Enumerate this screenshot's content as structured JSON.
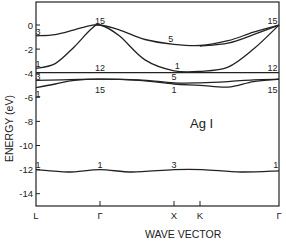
{
  "chart_data": {
    "type": "line",
    "title": "Ag I",
    "xlabel": "WAVE VECTOR",
    "ylabel": "ENERGY (eV)",
    "ylim": [
      -15,
      1.9
    ],
    "grid": false,
    "legend": null,
    "x_ticks": [
      {
        "label": "L",
        "pos": 0.0
      },
      {
        "label": "Γ",
        "pos": 1.0
      },
      {
        "label": "X",
        "pos": 2.15
      },
      {
        "label": "K",
        "pos": 2.56
      },
      {
        "label": "Γ",
        "pos": 3.8
      }
    ],
    "y_ticks": [
      0,
      -2,
      -4,
      -6,
      -8,
      -10,
      -12,
      -14
    ],
    "y_tick_labels": [
      "0",
      "-2",
      "-4",
      "-6",
      "-8",
      "-10",
      "-12",
      "-14"
    ],
    "series": [
      {
        "name": "upper valence band 3→15→5→15",
        "x": [
          0,
          0.3,
          0.6,
          0.85,
          1.0,
          1.3,
          1.7,
          2.15,
          2.56,
          3.0,
          3.4,
          3.8
        ],
        "y": [
          -0.9,
          -0.8,
          -0.4,
          -0.05,
          0.0,
          -0.4,
          -1.2,
          -1.6,
          -1.7,
          -1.3,
          -0.6,
          0.0
        ]
      },
      {
        "name": "upper valence band 1→15→1→15",
        "x": [
          0,
          0.3,
          0.6,
          0.85,
          1.0,
          1.3,
          1.7,
          2.15,
          2.56,
          3.0,
          3.4,
          3.8
        ],
        "y": [
          -3.6,
          -3.2,
          -1.8,
          -0.4,
          0.0,
          -0.9,
          -2.9,
          -3.8,
          -3.85,
          -3.5,
          -2.0,
          0.0
        ]
      },
      {
        "name": "upper valence band (K branch)",
        "x": [
          2.56,
          3.0,
          3.4,
          3.8
        ],
        "y": [
          -1.75,
          -1.5,
          -0.8,
          0.0
        ]
      },
      {
        "name": "flat band 12",
        "x": [
          0,
          1.0,
          2.15,
          2.56,
          3.8
        ],
        "y": [
          -3.95,
          -3.95,
          -3.95,
          -3.95,
          -3.95
        ]
      },
      {
        "name": "band 3→15→5→15",
        "x": [
          0,
          0.4,
          1.0,
          1.6,
          2.15,
          2.56,
          3.0,
          3.4,
          3.8
        ],
        "y": [
          -4.6,
          -4.55,
          -4.5,
          -4.55,
          -4.8,
          -4.8,
          -4.7,
          -4.55,
          -4.5
        ]
      },
      {
        "name": "band 1→15→1→15",
        "x": [
          0,
          0.3,
          0.6,
          1.0,
          1.6,
          2.15,
          2.56,
          3.0,
          3.4,
          3.8
        ],
        "y": [
          -5.2,
          -4.9,
          -4.6,
          -4.5,
          -4.6,
          -4.9,
          -5.0,
          -5.15,
          -4.7,
          -4.5
        ]
      },
      {
        "name": "low band 1→1→3→1",
        "x": [
          0,
          0.5,
          1.0,
          1.5,
          2.15,
          2.6,
          3.2,
          3.8
        ],
        "y": [
          -12.0,
          -12.2,
          -12.0,
          -12.2,
          -12.0,
          -12.0,
          -12.2,
          -12.1
        ]
      }
    ],
    "annotations": [
      {
        "text": "3",
        "x": 0.03,
        "y": -0.55
      },
      {
        "text": "15",
        "x": 1.0,
        "y": 0.35
      },
      {
        "text": "5",
        "x": 2.1,
        "y": -1.15
      },
      {
        "text": "15",
        "x": 3.7,
        "y": 0.35
      },
      {
        "text": "1",
        "x": 0.03,
        "y": -3.25
      },
      {
        "text": "1",
        "x": 2.2,
        "y": -3.4
      },
      {
        "text": "12",
        "x": 1.0,
        "y": -3.6
      },
      {
        "text": "12",
        "x": 3.7,
        "y": -3.6
      },
      {
        "text": "3",
        "x": 0.03,
        "y": -4.35
      },
      {
        "text": "5",
        "x": 2.15,
        "y": -4.3
      },
      {
        "text": "1",
        "x": 0.03,
        "y": -5.7
      },
      {
        "text": "15",
        "x": 1.0,
        "y": -5.4
      },
      {
        "text": "1",
        "x": 2.15,
        "y": -5.4
      },
      {
        "text": "15",
        "x": 3.7,
        "y": -5.4
      },
      {
        "text": "1",
        "x": 0.03,
        "y": -11.6
      },
      {
        "text": "1",
        "x": 1.0,
        "y": -11.6
      },
      {
        "text": "3",
        "x": 2.15,
        "y": -11.6
      },
      {
        "text": "1",
        "x": 3.75,
        "y": -11.6
      }
    ]
  },
  "labels": {
    "title": "Ag I",
    "xlabel": "WAVE VECTOR",
    "ylabel": "ENERGY (eV)"
  }
}
